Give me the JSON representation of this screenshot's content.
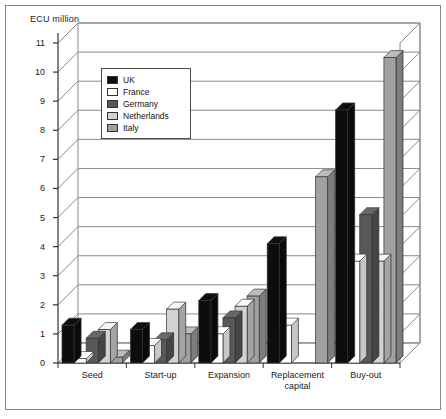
{
  "axis_title": "ECU million",
  "legend": {
    "position": "inside-top-left",
    "items": [
      {
        "label": "UK",
        "color": "#0d0d0d"
      },
      {
        "label": "France",
        "color": "#ffffff"
      },
      {
        "label": "Germany",
        "color": "#585858"
      },
      {
        "label": "Netherlands",
        "color": "#d2d2d2"
      },
      {
        "label": "Italy",
        "color": "#a0a0a0"
      }
    ]
  },
  "chart_data": {
    "type": "bar",
    "title": "",
    "subtitle": "",
    "xlabel": "",
    "ylabel": "ECU million",
    "ylim": [
      0,
      11
    ],
    "yticks": [
      0,
      1,
      2,
      3,
      4,
      5,
      6,
      7,
      8,
      9,
      10,
      11
    ],
    "ytick_labels": [
      "0",
      "1",
      "2",
      "3",
      "4",
      "5",
      "6",
      "7",
      "8",
      "9",
      "10",
      "11"
    ],
    "grid": true,
    "three_d": true,
    "legend_position": "inside-top-left",
    "categories": [
      "Seed",
      "Start-up",
      "Expansion",
      "Replacement capital",
      "Buy-out"
    ],
    "series": [
      {
        "name": "UK",
        "color": "#0d0d0d",
        "values": [
          1.3,
          1.15,
          2.15,
          4.1,
          8.7
        ]
      },
      {
        "name": "France",
        "color": "#ffffff",
        "values": [
          0.15,
          0.6,
          1.0,
          1.3,
          3.5
        ]
      },
      {
        "name": "Germany",
        "color": "#585858",
        "values": [
          0.85,
          0.8,
          1.55,
          0,
          5.1
        ]
      },
      {
        "name": "Netherlands",
        "color": "#d2d2d2",
        "values": [
          1.15,
          1.85,
          1.95,
          0,
          3.5
        ]
      },
      {
        "name": "Italy",
        "color": "#a0a0a0",
        "values": [
          0.2,
          1.0,
          2.3,
          6.4,
          10.5
        ]
      }
    ]
  },
  "colors": {
    "frame": "#8a8a8a",
    "grid": "#8a8a8a",
    "axis": "#333333",
    "text": "#1a1a1a",
    "background": "#ffffff"
  }
}
